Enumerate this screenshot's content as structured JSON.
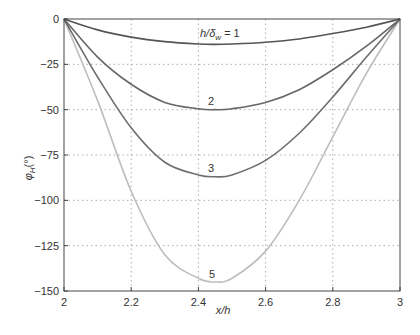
{
  "chart_data": {
    "type": "line",
    "title": "",
    "xlabel": "x/h",
    "ylabel": "φH(°)",
    "xlim": [
      2,
      3
    ],
    "ylim": [
      -150,
      0
    ],
    "xticks": [
      2,
      2.2,
      2.4,
      2.6,
      2.8,
      3
    ],
    "xtick_labels": [
      "2",
      "2.2",
      "2.4",
      "2.6",
      "2.8",
      "3"
    ],
    "yticks": [
      0,
      -25,
      -50,
      -75,
      -100,
      -125,
      -150
    ],
    "ytick_labels": [
      "0",
      "−25",
      "−50",
      "−75",
      "−100",
      "−125",
      "−150"
    ],
    "grid": true,
    "legend": "inline curve labels",
    "series": [
      {
        "name": "h/δw = 1",
        "label": "h/δw = 1",
        "color": "#555555",
        "min_value": -14,
        "min_x": 2.45,
        "x": [
          2,
          2.1,
          2.2,
          2.3,
          2.4,
          2.45,
          2.5,
          2.6,
          2.7,
          2.8,
          2.9,
          3
        ],
        "values": [
          0,
          -6,
          -10,
          -12.5,
          -13.8,
          -14,
          -13.8,
          -12.8,
          -11,
          -8,
          -4.5,
          0
        ]
      },
      {
        "name": "2",
        "label": "2",
        "color": "#666666",
        "min_value": -50,
        "min_x": 2.45,
        "x": [
          2,
          2.1,
          2.2,
          2.3,
          2.4,
          2.45,
          2.5,
          2.6,
          2.7,
          2.8,
          2.9,
          3
        ],
        "values": [
          0,
          -21,
          -36,
          -46,
          -49.5,
          -50,
          -49.5,
          -46,
          -39,
          -28,
          -15,
          0
        ]
      },
      {
        "name": "3",
        "label": "3",
        "color": "#6e6e6e",
        "min_value": -87,
        "min_x": 2.45,
        "x": [
          2,
          2.1,
          2.2,
          2.3,
          2.4,
          2.45,
          2.5,
          2.6,
          2.7,
          2.8,
          2.9,
          3
        ],
        "values": [
          0,
          -32,
          -60,
          -79,
          -86,
          -87,
          -86,
          -78,
          -63,
          -43,
          -21,
          0
        ]
      },
      {
        "name": "5",
        "label": "5",
        "color": "#bdbdbd",
        "min_value": -145,
        "min_x": 2.45,
        "x": [
          2,
          2.1,
          2.2,
          2.3,
          2.4,
          2.45,
          2.5,
          2.6,
          2.7,
          2.8,
          2.9,
          3
        ],
        "values": [
          0,
          -45,
          -95,
          -130,
          -143,
          -145,
          -143,
          -128,
          -100,
          -65,
          -30,
          0
        ]
      }
    ]
  },
  "labels": {
    "xlabel": "x/h",
    "ylabel_main": "φ",
    "ylabel_sub": "H",
    "ylabel_unit": "(°)",
    "curve1_prefix": "h/δ",
    "curve1_sub": "w",
    "curve1_suffix": " = 1",
    "curve2": "2",
    "curve3": "3",
    "curve5": "5"
  }
}
